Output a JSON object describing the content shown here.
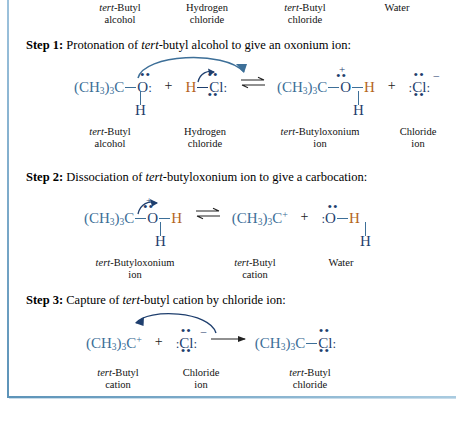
{
  "figure": {
    "accent_color": "#3d6f98",
    "heteroatom_color": "#1f3f6e",
    "hydrogen_color": "#b5651d",
    "frame_color": "#5c93b8"
  },
  "overall_labels": [
    {
      "line1": "tert-Butyl",
      "line1_italic": "tert",
      "line2": "alcohol"
    },
    {
      "line1": "Hydrogen",
      "line1_italic": "",
      "line2": "chloride"
    },
    {
      "line1": "tert-Butyl",
      "line1_italic": "tert",
      "line2": "chloride"
    },
    {
      "line1": "Water",
      "line1_italic": "",
      "line2": ""
    }
  ],
  "steps": [
    {
      "number": "Step 1:",
      "description": "Protonation of tert-butyl alcohol to give an oxonium ion:",
      "desc_pre": "Protonation of ",
      "desc_italic": "tert",
      "desc_post": "-butyl alcohol to give an oxonium ion:",
      "reaction_arrow": "equilibrium",
      "curved_arrow": "O lone pair attacks H of HCl",
      "species": [
        {
          "formula_text": "(CH3)3C—O:",
          "alkyl": "(CH",
          "sub1": "3",
          "mid": ")",
          "sub2": "3",
          "tail": "C",
          "atom": "O",
          "charge": "",
          "extra_h": "H",
          "label_line1": "tert-Butyl",
          "label_italic": "tert",
          "label_line2": "alcohol"
        },
        {
          "formula_text": "H—Cl:",
          "atom": "Cl",
          "h": "H",
          "charge": "",
          "label_line1": "Hydrogen",
          "label_italic": "",
          "label_line2": "chloride"
        },
        {
          "formula_text": "(CH3)3C—O(+)H",
          "alkyl": "(CH",
          "sub1": "3",
          "mid": ")",
          "sub2": "3",
          "tail": "C",
          "atom": "O",
          "charge": "+",
          "h": "H",
          "extra_h": "H",
          "label_line1": "tert-Butyloxonium",
          "label_italic": "tert",
          "label_line2": "ion"
        },
        {
          "formula_text": ":Cl:(-)",
          "atom": "Cl",
          "charge": "–",
          "label_line1": "Chloride",
          "label_italic": "",
          "label_line2": "ion"
        }
      ]
    },
    {
      "number": "Step 2:",
      "description": "Dissociation of tert-butyloxonium ion to give a carbocation:",
      "desc_pre": "Dissociation of ",
      "desc_italic": "tert",
      "desc_post": "-butyloxonium ion to give a carbocation:",
      "reaction_arrow": "equilibrium",
      "curved_arrow": "C—O bond breaks, electrons to O",
      "species": [
        {
          "formula_text": "(CH3)3C—O(+)H",
          "alkyl": "(CH",
          "sub1": "3",
          "mid": ")",
          "sub2": "3",
          "tail": "C",
          "atom": "O",
          "charge": "+",
          "h": "H",
          "extra_h": "H",
          "label_line1": "tert-Butyloxonium",
          "label_italic": "tert",
          "label_line2": "ion"
        },
        {
          "formula_text": "(CH3)3C+",
          "alkyl": "(CH",
          "sub1": "3",
          "mid": ")",
          "sub2": "3",
          "tail": "C",
          "charge": "+",
          "label_line1": "tert-Butyl",
          "label_italic": "tert",
          "label_line2": "cation"
        },
        {
          "formula_text": ":O—H",
          "atom": "O",
          "h": "H",
          "extra_h": "H",
          "label_line1": "Water",
          "label_italic": "",
          "label_line2": ""
        }
      ]
    },
    {
      "number": "Step 3:",
      "description": "Capture of tert-butyl cation by chloride ion:",
      "desc_pre": "Capture of ",
      "desc_italic": "tert",
      "desc_post": "-butyl cation by chloride ion:",
      "reaction_arrow": "forward",
      "curved_arrow": "Cl lone pair attacks carbocation",
      "species": [
        {
          "formula_text": "(CH3)3C+",
          "alkyl": "(CH",
          "sub1": "3",
          "mid": ")",
          "sub2": "3",
          "tail": "C",
          "charge": "+",
          "label_line1": "tert-Butyl",
          "label_italic": "tert",
          "label_line2": "cation"
        },
        {
          "formula_text": ":Cl:(-)",
          "atom": "Cl",
          "charge": "–",
          "label_line1": "Chloride",
          "label_italic": "",
          "label_line2": "ion"
        },
        {
          "formula_text": "(CH3)3C—Cl:",
          "alkyl": "(CH",
          "sub1": "3",
          "mid": ")",
          "sub2": "3",
          "tail": "C",
          "atom": "Cl",
          "charge": "",
          "label_line1": "tert-Butyl",
          "label_italic": "tert",
          "label_line2": "chloride"
        }
      ]
    }
  ],
  "operators": {
    "plus": "+",
    "equilibrium": "⇌",
    "forward": "⟶"
  }
}
